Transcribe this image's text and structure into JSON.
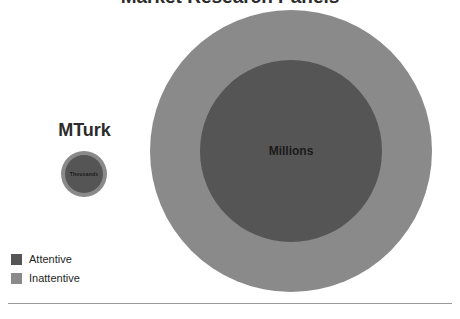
{
  "chart_data": {
    "type": "bubble",
    "title": "Market Research Panels",
    "xlabel": "",
    "ylabel": "",
    "grid": false,
    "legend_position": "bottom-left",
    "annotations": [
      "MTurk",
      "Market Research Panels"
    ],
    "series": [
      {
        "name": "Inattentive",
        "color": "#8a8a8a",
        "values": [
          {
            "group": "MTurk",
            "label": "",
            "radius_px": 23
          },
          {
            "group": "Market Research Panels",
            "label": "",
            "radius_px": 141
          }
        ]
      },
      {
        "name": "Attentive",
        "color": "#555555",
        "values": [
          {
            "group": "MTurk",
            "label": "Thousands",
            "radius_px": 19
          },
          {
            "group": "Market Research Panels",
            "label": "Millions",
            "radius_px": 91
          }
        ]
      }
    ],
    "categories": [
      "MTurk",
      "Market Research Panels"
    ]
  },
  "slide": {
    "title": "Market Research Panels",
    "mturk": {
      "label": "MTurk",
      "inner_label": "Thousands"
    },
    "panels": {
      "inner_label": "Millions"
    },
    "legend": {
      "items": [
        {
          "label": "Attentive",
          "color": "#555555"
        },
        {
          "label": "Inattentive",
          "color": "#8a8a8a"
        }
      ]
    }
  }
}
